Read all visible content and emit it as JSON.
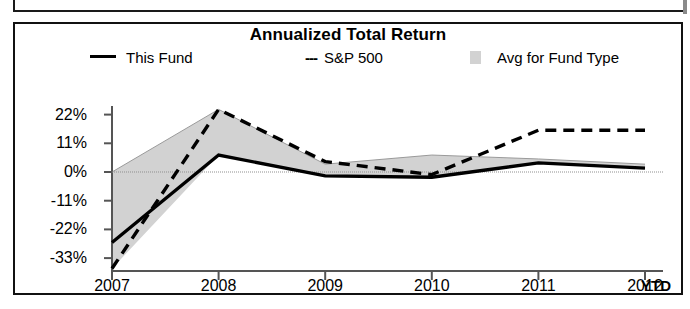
{
  "chart_data": {
    "type": "line",
    "title": "Annualized Total Return",
    "xlabel": "",
    "ylabel": "",
    "x": [
      "2007",
      "2008",
      "2009",
      "2010",
      "2011",
      "2012"
    ],
    "xtick_labels": [
      "2007",
      "2008",
      "2009",
      "2010",
      "2011",
      "2012"
    ],
    "xtick_suffix": "YTD",
    "ytick_labels": [
      "22%",
      "11%",
      "0%",
      "-11%",
      "-22%",
      "-33%"
    ],
    "ytick_values": [
      22,
      11,
      0,
      -11,
      -22,
      -33
    ],
    "ylim": [
      -38,
      26
    ],
    "grid": false,
    "legend_position": "top",
    "zero_line": true,
    "series": [
      {
        "name": "This Fund",
        "style": "solid",
        "color": "#000000",
        "values": [
          -27,
          6.5,
          -1.5,
          -2,
          3.5,
          1.5
        ]
      },
      {
        "name": "S&P 500",
        "style": "dashed",
        "color": "#000000",
        "values": [
          -37,
          24,
          4,
          -1,
          16,
          16
        ]
      },
      {
        "name": "Avg for Fund Type",
        "style": "band",
        "color": "#d2d2d2",
        "band_upper": [
          0,
          24,
          3,
          6.5,
          5,
          3
        ],
        "band_lower": [
          -37,
          6.5,
          -1.5,
          -2,
          3.5,
          1.5
        ]
      }
    ]
  },
  "legend": {
    "this_fund": "This Fund",
    "sp500": "S&P 500",
    "sp500_dashes": "---",
    "avg_fund_type": "Avg for Fund Type"
  },
  "colors": {
    "series_line": "#000000",
    "band_fill": "#d2d2d2",
    "frame": "#111111",
    "axis": "#555555"
  }
}
